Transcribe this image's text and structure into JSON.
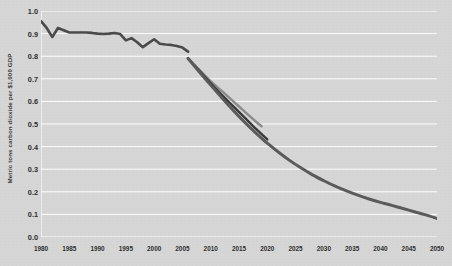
{
  "chart_data": {
    "type": "line",
    "title": "",
    "subtitle": "",
    "xlabel": "",
    "ylabel": "Metric tons carbon dioxide per $1,000 GDP",
    "xlim": [
      1980,
      2050
    ],
    "ylim": [
      0.0,
      1.0
    ],
    "grid": true,
    "grid_axis": "y",
    "grid_color": "#ffffff",
    "background_color": "#d6d6d6",
    "legend": "none",
    "xticks": [
      1980,
      1985,
      1990,
      1995,
      2000,
      2005,
      2010,
      2015,
      2020,
      2025,
      2030,
      2035,
      2040,
      2045,
      2050
    ],
    "xtick_labels": [
      "1980",
      "1985",
      "1990",
      "1995",
      "2000",
      "2005",
      "2010",
      "2015",
      "2020",
      "2025",
      "2030",
      "2035",
      "2040",
      "2045",
      "2050"
    ],
    "yticks": [
      0.0,
      0.1,
      0.2,
      0.3,
      0.4,
      0.5,
      0.6,
      0.7,
      0.8,
      0.9,
      1.0
    ],
    "ytick_labels": [
      "0.0",
      "0.1",
      "0.2",
      "0.3",
      "0.4",
      "0.5",
      "0.6",
      "0.7",
      "0.8",
      "0.9",
      "1.0"
    ],
    "series": [
      {
        "name": "Historical carbon intensity",
        "color": "#4a4a4a",
        "width": 2.6,
        "x": [
          1980,
          1981,
          1982,
          1983,
          1984,
          1985,
          1986,
          1987,
          1988,
          1989,
          1990,
          1991,
          1992,
          1993,
          1994,
          1995,
          1996,
          1997,
          1998,
          1999,
          2000,
          2001,
          2002,
          2003,
          2004,
          2005,
          2006
        ],
        "values": [
          0.955,
          0.925,
          0.885,
          0.925,
          0.915,
          0.905,
          0.905,
          0.905,
          0.905,
          0.903,
          0.9,
          0.898,
          0.9,
          0.903,
          0.898,
          0.87,
          0.88,
          0.862,
          0.84,
          0.858,
          0.875,
          0.855,
          0.852,
          0.85,
          0.845,
          0.838,
          0.82
        ]
      },
      {
        "name": "Projection - upper path",
        "color": "#8c8c8c",
        "width": 2.4,
        "x": [
          2006,
          2008,
          2010,
          2012,
          2014,
          2016,
          2018,
          2019
        ],
        "values": [
          0.79,
          0.74,
          0.69,
          0.645,
          0.6,
          0.555,
          0.51,
          0.49
        ]
      },
      {
        "name": "Projection - middle path",
        "color": "#3a3a3a",
        "width": 2.4,
        "x": [
          2006,
          2008,
          2010,
          2012,
          2014,
          2016,
          2018,
          2020
        ],
        "values": [
          0.79,
          0.735,
          0.68,
          0.628,
          0.578,
          0.528,
          0.478,
          0.432
        ]
      },
      {
        "name": "Projection - lower long path",
        "color": "#5a5a5a",
        "width": 3.0,
        "x": [
          2006,
          2008,
          2010,
          2012,
          2014,
          2016,
          2018,
          2020,
          2022,
          2024,
          2026,
          2028,
          2030,
          2032,
          2034,
          2036,
          2038,
          2040,
          2042,
          2044,
          2046,
          2048,
          2050
        ],
        "values": [
          0.79,
          0.73,
          0.672,
          0.615,
          0.56,
          0.508,
          0.46,
          0.415,
          0.375,
          0.338,
          0.305,
          0.275,
          0.249,
          0.225,
          0.204,
          0.185,
          0.168,
          0.153,
          0.14,
          0.126,
          0.112,
          0.098,
          0.082
        ]
      }
    ]
  }
}
